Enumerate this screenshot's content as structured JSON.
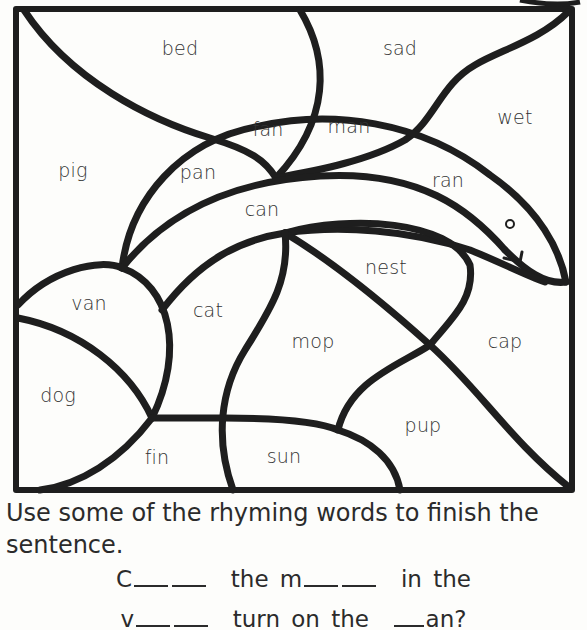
{
  "puzzle": {
    "words": [
      {
        "id": "bed",
        "label": "bed",
        "x": 180,
        "y": 48
      },
      {
        "id": "sad",
        "label": "sad",
        "x": 400,
        "y": 48
      },
      {
        "id": "wet",
        "label": "wet",
        "x": 515,
        "y": 117
      },
      {
        "id": "fan",
        "label": "fan",
        "x": 268,
        "y": 129
      },
      {
        "id": "man",
        "label": "man",
        "x": 349,
        "y": 126
      },
      {
        "id": "pig",
        "label": "pig",
        "x": 73,
        "y": 170
      },
      {
        "id": "pan",
        "label": "pan",
        "x": 198,
        "y": 172
      },
      {
        "id": "ran",
        "label": "ran",
        "x": 448,
        "y": 180
      },
      {
        "id": "can",
        "label": "can",
        "x": 262,
        "y": 209
      },
      {
        "id": "nest",
        "label": "nest",
        "x": 386,
        "y": 267
      },
      {
        "id": "van",
        "label": "van",
        "x": 89,
        "y": 303
      },
      {
        "id": "cat",
        "label": "cat",
        "x": 208,
        "y": 310
      },
      {
        "id": "mop",
        "label": "mop",
        "x": 313,
        "y": 341
      },
      {
        "id": "cap",
        "label": "cap",
        "x": 505,
        "y": 341
      },
      {
        "id": "dog",
        "label": "dog",
        "x": 58,
        "y": 395
      },
      {
        "id": "pup",
        "label": "pup",
        "x": 423,
        "y": 425
      },
      {
        "id": "fin",
        "label": "fin",
        "x": 157,
        "y": 457
      },
      {
        "id": "sun",
        "label": "sun",
        "x": 284,
        "y": 456
      }
    ]
  },
  "instructions": "Use some of the rhyming words to finish the sentence.",
  "sentence": {
    "line1": {
      "start": "C",
      "mid1": "the  m",
      "end": "in  the"
    },
    "line2": {
      "start": "v",
      "mid": "turn  on  the",
      "end": "an?"
    }
  }
}
